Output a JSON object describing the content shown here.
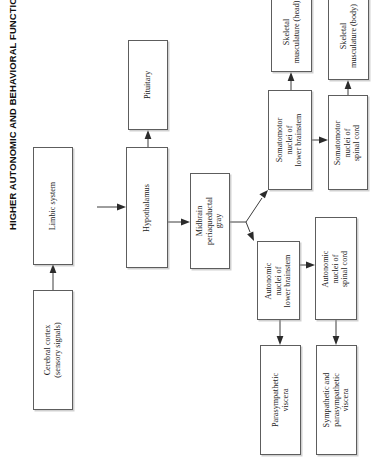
{
  "title": "HIGHER AUTONOMIC AND BEHAVIORAL FUNCTIONS",
  "colors": {
    "background": "#ffffff",
    "box_border": "#5d5d5d",
    "text": "#1a1a1a",
    "title_text": "#100f0f",
    "connector": "#3c3c3c"
  },
  "nodes": [
    {
      "id": "cerebral-cortex",
      "line1": "Cerebral cortex",
      "line2": "(sensory signals)",
      "line3": ""
    },
    {
      "id": "limbic-system",
      "line1": "Limbic system",
      "line2": "",
      "line3": ""
    },
    {
      "id": "hypothalamus",
      "line1": "Hypothalamus",
      "line2": "",
      "line3": ""
    },
    {
      "id": "pituitary",
      "line1": "Pituitary",
      "line2": "",
      "line3": ""
    },
    {
      "id": "midbrain-periaqueductal-gray",
      "line1": "Midbrain",
      "line2": "periaqueductal",
      "line3": "gray"
    },
    {
      "id": "somatomotor-nuclei-lower-brainstem",
      "line1": "Somatomotor",
      "line2": "nuclei of",
      "line3": "lower brainstem"
    },
    {
      "id": "autonomic-nuclei-lower-brainstem",
      "line1": "Autonomic",
      "line2": "nuclei of",
      "line3": "lower brainstem"
    },
    {
      "id": "somatomotor-nuclei-spinal-cord",
      "line1": "Somatomotor",
      "line2": "nuclei of",
      "line3": "spinal cord"
    },
    {
      "id": "autonomic-nuclei-spinal-cord",
      "line1": "Autonomic",
      "line2": "nuclei of",
      "line3": "spinal cord"
    },
    {
      "id": "skeletal-musculature-head",
      "line1": "Skeletal",
      "line2": "musculature (head)",
      "line3": ""
    },
    {
      "id": "skeletal-musculature-body",
      "line1": "Skeletal",
      "line2": "musculature (body)",
      "line3": ""
    },
    {
      "id": "parasympathetic-viscera",
      "line1": "Parasympathetic",
      "line2": "viscera",
      "line3": ""
    },
    {
      "id": "sympathetic-parasympathetic-viscera",
      "line1": "Sympathetic and",
      "line2": "parasympathetic",
      "line3": "viscera"
    }
  ],
  "connections": [
    {
      "from": "cerebral-cortex",
      "to": "limbic-system"
    },
    {
      "from": "limbic-system",
      "to": "hypothalamus"
    },
    {
      "from": "hypothalamus",
      "to": "pituitary"
    },
    {
      "from": "hypothalamus",
      "to": "midbrain-periaqueductal-gray"
    },
    {
      "from": "midbrain-periaqueductal-gray",
      "to": "somatomotor-nuclei-lower-brainstem"
    },
    {
      "from": "midbrain-periaqueductal-gray",
      "to": "autonomic-nuclei-lower-brainstem"
    },
    {
      "from": "somatomotor-nuclei-lower-brainstem",
      "to": "skeletal-musculature-head"
    },
    {
      "from": "somatomotor-nuclei-lower-brainstem",
      "to": "somatomotor-nuclei-spinal-cord"
    },
    {
      "from": "somatomotor-nuclei-spinal-cord",
      "to": "skeletal-musculature-body"
    },
    {
      "from": "autonomic-nuclei-lower-brainstem",
      "to": "parasympathetic-viscera"
    },
    {
      "from": "autonomic-nuclei-lower-brainstem",
      "to": "autonomic-nuclei-spinal-cord"
    },
    {
      "from": "autonomic-nuclei-spinal-cord",
      "to": "sympathetic-parasympathetic-viscera"
    }
  ]
}
